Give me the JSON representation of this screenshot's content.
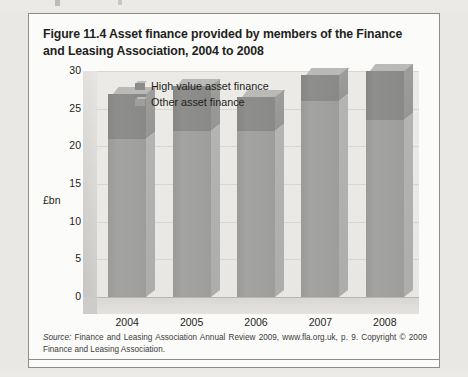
{
  "figure": {
    "title": "Figure 11.4  Asset finance provided by members of the Finance and Leasing Association, 2004 to 2008",
    "source_prefix": "Source:",
    "source_text": " Finance and Leasing Association Annual Review 2009, www.fla.org.uk, p. 9. Copyright © 2009 Finance and Leasing Association."
  },
  "chart_data": {
    "type": "bar",
    "subtype": "stacked-3d-column",
    "title": "Asset finance provided by members of the Finance and Leasing Association, 2004 to 2008",
    "categories": [
      "2004",
      "2005",
      "2006",
      "2007",
      "2008"
    ],
    "series": [
      {
        "name": "Other asset finance",
        "values": [
          21.0,
          22.0,
          22.0,
          26.0,
          23.5
        ]
      },
      {
        "name": "High value asset finance",
        "values": [
          6.0,
          6.0,
          4.5,
          3.5,
          6.5
        ]
      }
    ],
    "totals": [
      27.0,
      28.0,
      26.5,
      29.5,
      30.0
    ],
    "xlabel": "",
    "ylabel": "£bn",
    "ylim": [
      0,
      30
    ],
    "yticks": [
      0,
      5,
      10,
      15,
      20,
      25,
      30
    ],
    "ytick_labels": [
      "0",
      "5",
      "10",
      "15",
      "20",
      "25",
      "30"
    ],
    "grid": true,
    "legend_position": "top-left-inside",
    "legend": [
      "High value asset finance",
      "Other asset finance"
    ],
    "colors": {
      "high_value": "#8b8b8a",
      "other": "#9e9e9d",
      "plot_background": "#ebe9e5",
      "gridline": "#d8d6d2"
    }
  }
}
